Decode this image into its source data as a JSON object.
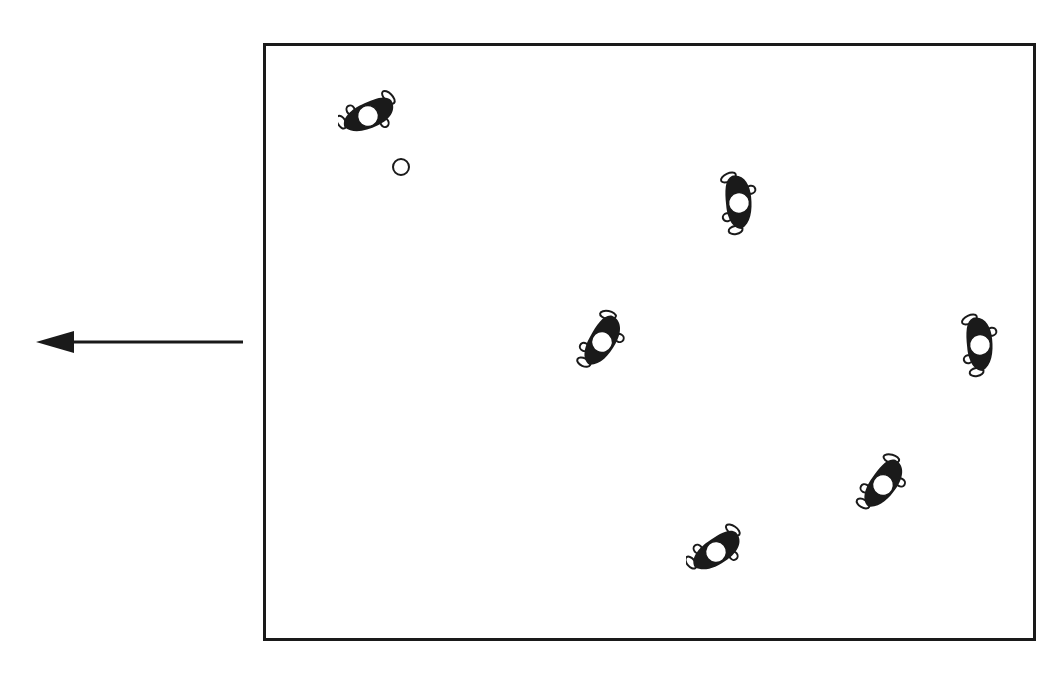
{
  "diagram": {
    "colors": {
      "ink": "#1a1a1a",
      "background": "#ffffff"
    },
    "field": {
      "x": 263,
      "y": 43,
      "width": 773,
      "height": 598
    },
    "arrow": {
      "direction": "left",
      "x1": 243,
      "y1": 342,
      "x2": 36,
      "y2": 342
    },
    "ball": {
      "x": 401,
      "y": 167,
      "r": 9
    },
    "players": [
      {
        "id": "player-1",
        "x": 368,
        "y": 116,
        "rotation": 60
      },
      {
        "id": "player-2",
        "x": 739,
        "y": 203,
        "rotation": -10
      },
      {
        "id": "player-3",
        "x": 602,
        "y": 342,
        "rotation": 25
      },
      {
        "id": "player-4",
        "x": 980,
        "y": 345,
        "rotation": -10
      },
      {
        "id": "player-5",
        "x": 883,
        "y": 485,
        "rotation": 30
      },
      {
        "id": "player-6",
        "x": 716,
        "y": 552,
        "rotation": 50
      }
    ]
  }
}
